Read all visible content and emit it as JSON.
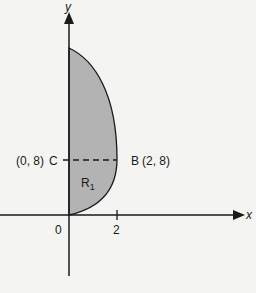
{
  "diagram": {
    "axes": {
      "x_label": "x",
      "y_label": "y",
      "origin_label": "0",
      "x_tick_label": "2"
    },
    "points": {
      "C": {
        "name": "C",
        "coords": "(0, 8)"
      },
      "B": {
        "name": "B",
        "coords": "(2, 8)"
      }
    },
    "region": {
      "label": "R",
      "subscript": "1"
    },
    "colors": {
      "region_fill": "#b3b3b3",
      "line": "#1a1a1a",
      "background": "#f4f4f2"
    }
  }
}
